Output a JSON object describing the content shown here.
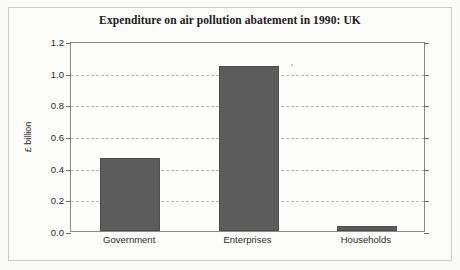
{
  "chart_data": {
    "type": "bar",
    "title": "Expenditure on air pollution abatement in 1990: UK",
    "xlabel": "",
    "ylabel": "£ billion",
    "categories": [
      "Government",
      "Enterprises",
      "Households"
    ],
    "values": [
      0.46,
      1.04,
      0.03
    ],
    "ylim": [
      0.0,
      1.2
    ],
    "ytick_labels": [
      "0.0",
      "0.2",
      "0.4",
      "0.6",
      "0.8",
      "1.0",
      "1.2"
    ],
    "ytick_values": [
      0.0,
      0.2,
      0.4,
      0.6,
      0.8,
      1.0,
      1.2
    ],
    "grid": "horizontal-dashed",
    "legend": "none",
    "bar_color": "#5c5c5c",
    "gridline_color": "#b9b9b7",
    "axis_color": "#8a8a88",
    "background_color": "#fdfdfc"
  }
}
